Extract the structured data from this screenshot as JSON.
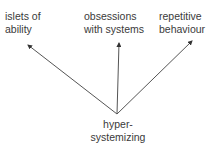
{
  "diagram": {
    "root": {
      "line1": "hyper-",
      "line2": "systemizing"
    },
    "targets": [
      {
        "line1": "islets of",
        "line2": "ability"
      },
      {
        "line1": "obsessions",
        "line2": "with systems"
      },
      {
        "line1": "repetitive",
        "line2": "behaviour"
      }
    ],
    "line_color": "#555555"
  }
}
